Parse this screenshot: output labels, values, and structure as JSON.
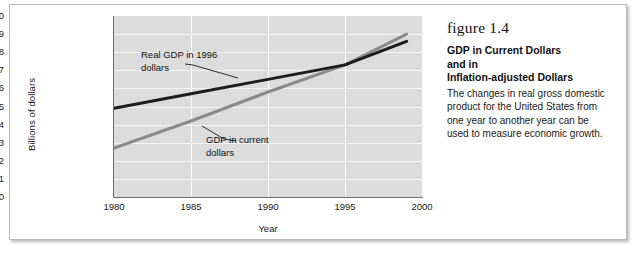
{
  "chart_data": {
    "type": "line",
    "title": "",
    "xlabel": "Year",
    "ylabel": "Billions of dollars",
    "xlim": [
      1980,
      2000
    ],
    "ylim": [
      0,
      10
    ],
    "grid": true,
    "legend_position": "inline-annotations",
    "xticks": [
      "1980",
      "1985",
      "1990",
      "1995",
      "2000"
    ],
    "yticks": [
      "10",
      "9",
      "8",
      "7",
      "6",
      "5",
      "4",
      "3",
      "2",
      "1",
      "0"
    ],
    "series": [
      {
        "name": "Real GDP in 1996 dollars",
        "color": "#1c1c1c",
        "x": [
          1980,
          1985,
          1990,
          1995,
          1999
        ],
        "values": [
          4.9,
          5.7,
          6.5,
          7.3,
          8.6
        ]
      },
      {
        "name": "GDP in current dollars",
        "color": "#8a8a8a",
        "x": [
          1980,
          1985,
          1990,
          1995,
          1999
        ],
        "values": [
          2.7,
          4.2,
          5.8,
          7.3,
          9.0
        ]
      }
    ],
    "annotations": [
      {
        "id": "real",
        "text": "Real GDP in 1996\ndollars"
      },
      {
        "id": "current",
        "text": "GDP in current\ndollars"
      }
    ]
  },
  "caption": {
    "figure_number": "figure 1.4",
    "title": "GDP in Current Dollars and in Inflation-adjusted Dollars",
    "title_line1": "GDP in Current Dollars",
    "title_line2": "and in",
    "title_line3": "Inflation-adjusted Dollars",
    "body": "The changes in real gross domestic product for the United States from one year to another year can be used to measure economic growth."
  },
  "colors": {
    "plot_background": "#dcdcdc",
    "gridline": "#f4f4f4",
    "axis": "#6e6e6e",
    "series_real": "#1c1c1c",
    "series_current": "#8a8a8a",
    "frame_border": "#b9b9b9"
  }
}
